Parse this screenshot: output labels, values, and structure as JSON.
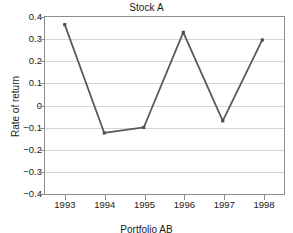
{
  "chart_data": {
    "type": "line",
    "title": "Stock A",
    "xlabel": "",
    "ylabel": "Rate of return",
    "caption": "Portfolio AB",
    "categories": [
      "1993",
      "1994",
      "1995",
      "1996",
      "1997",
      "1998"
    ],
    "values": [
      0.365,
      -0.13,
      -0.105,
      0.33,
      -0.075,
      0.295
    ],
    "series": [
      {
        "name": "Stock A",
        "values": [
          0.365,
          -0.13,
          -0.105,
          0.33,
          -0.075,
          0.295
        ]
      }
    ],
    "ylim": [
      -0.4,
      0.4
    ],
    "y_ticks": [
      0.4,
      0.3,
      0.2,
      0.1,
      0,
      -0.1,
      -0.2,
      -0.3,
      -0.4
    ],
    "y_tick_labels": [
      "0.4",
      "0.3",
      "0.2",
      "0.1",
      "0",
      "−0.1",
      "−0.2",
      "−0.3",
      "−0.4"
    ],
    "x_tick_labels": [
      "1993",
      "1994",
      "1995",
      "1996",
      "1997",
      "1998"
    ],
    "grid": "horizontal",
    "legend": "none",
    "marker": "square",
    "line_color": "#595959",
    "marker_color": "#4d4d4d",
    "grid_color": "#d6d6d6",
    "axis_color": "#8d8d8d",
    "background": "#ffffff"
  }
}
